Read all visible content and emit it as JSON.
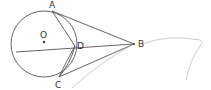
{
  "diagram": {
    "points": [
      {
        "id": "A",
        "label": "A",
        "x": 52,
        "y": 11,
        "label_x": 49,
        "label_y": 8
      },
      {
        "id": "O",
        "label": "O",
        "x": 44,
        "y": 42,
        "label_x": 40,
        "label_y": 38
      },
      {
        "id": "D",
        "label": "D",
        "x": 75,
        "y": 46,
        "label_x": 77,
        "label_y": 49
      },
      {
        "id": "C",
        "label": "C",
        "x": 59,
        "y": 77,
        "label_x": 55,
        "label_y": 88
      },
      {
        "id": "B",
        "label": "B",
        "x": 134,
        "y": 44,
        "label_x": 138,
        "label_y": 47
      }
    ],
    "circle": {
      "center": "O",
      "cx": 44,
      "cy": 44,
      "r": 33
    },
    "segments": [
      "AB",
      "AD",
      "DC",
      "CB",
      "DB",
      "chord through D"
    ],
    "colors": {
      "stroke": "#555555",
      "faint": "#bdbdbd",
      "label": "#333333"
    }
  }
}
